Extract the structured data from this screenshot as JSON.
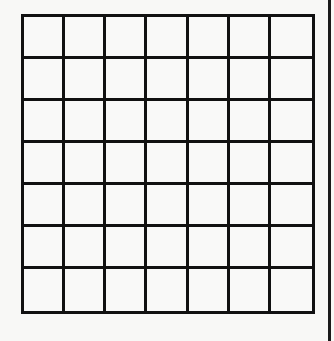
{
  "grid": {
    "rows": 7,
    "columns": 7,
    "line_color": "#111111",
    "background_color": "#f8f8f6",
    "cells_filled": []
  },
  "edge_bar": {
    "color": "#1a1a1a"
  }
}
